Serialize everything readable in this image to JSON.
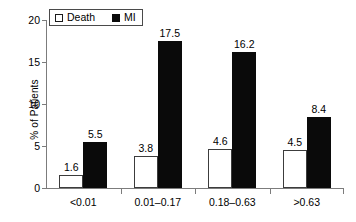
{
  "chart_data": {
    "type": "bar",
    "title": "",
    "xlabel": "",
    "ylabel": "% of Patients",
    "ylim": [
      0,
      20
    ],
    "yticks": [
      0,
      5,
      10,
      15,
      20
    ],
    "ytick_labels": [
      "0",
      "5",
      "10",
      "15",
      "20"
    ],
    "grid": false,
    "legend_position": "top-left",
    "categories": [
      "<0.01",
      "0.01–0.17",
      "0.18–0.63",
      ">0.63"
    ],
    "series": [
      {
        "name": "Death",
        "color": "#ffffff",
        "edge_color": "#000000",
        "values": [
          1.6,
          3.8,
          4.6,
          4.5
        ],
        "labels": [
          "1.6",
          "3.8",
          "4.6",
          "4.5"
        ]
      },
      {
        "name": "MI",
        "color": "#000000",
        "edge_color": "#000000",
        "values": [
          5.5,
          17.5,
          16.2,
          8.4
        ],
        "labels": [
          "5.5",
          "17.5",
          "16.2",
          "8.4"
        ]
      }
    ]
  },
  "legend": {
    "entries": [
      {
        "label": "Death",
        "swatch": "open-square-swatch"
      },
      {
        "label": "MI",
        "swatch": "filled-square-swatch"
      }
    ]
  },
  "axis": {
    "y_title": "% of Patients"
  }
}
